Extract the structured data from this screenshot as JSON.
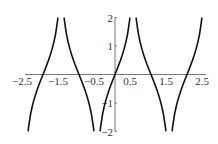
{
  "chart_data": {
    "type": "line",
    "title": "",
    "xlabel": "",
    "ylabel": "",
    "xlim": [
      -2.5,
      2.5
    ],
    "ylim": [
      -2,
      2
    ],
    "grid": false,
    "legend": null,
    "x_ticks": [
      -2.5,
      -1.5,
      -0.5,
      0.5,
      1.5,
      2.5
    ],
    "x_tick_labels": [
      "−2.5",
      "−1.5",
      "−0.5",
      "0.5",
      "1.5",
      "2.5"
    ],
    "y_ticks": [
      2,
      1,
      -1,
      -2
    ],
    "y_tick_labels": [
      "2",
      "1",
      "−1",
      "−2"
    ],
    "series": [
      {
        "name": "f(x)",
        "color": "#111111",
        "branches": [
          {
            "x": [
              -2.414,
              -2.4,
              -2.35,
              -2.3,
              -2.25,
              -2.2,
              -2.15,
              -2.1,
              -2.05,
              -2.0,
              -1.95,
              -1.9,
              -1.85,
              -1.8,
              -1.75,
              -1.7,
              -1.65,
              -1.6,
              -1.586
            ],
            "y": [
              -1.996,
              -1.843,
              -1.427,
              -1.124,
              -0.881,
              -0.674,
              -0.49,
              -0.319,
              -0.158,
              0,
              0.158,
              0.319,
              0.49,
              0.674,
              0.881,
              1.124,
              1.427,
              1.843,
              1.996
            ]
          },
          {
            "x": [
              -1.414,
              -1.4,
              -1.35,
              -1.3,
              -1.25,
              -1.2,
              -1.15,
              -1.1,
              -1.05,
              -1.0,
              -0.95,
              -0.9,
              -0.85,
              -0.8,
              -0.75,
              -0.7,
              -0.65,
              -0.6,
              -0.586
            ],
            "y": [
              1.996,
              1.843,
              1.427,
              1.124,
              0.881,
              0.674,
              0.49,
              0.319,
              0.158,
              0,
              -0.158,
              -0.319,
              -0.49,
              -0.674,
              -0.881,
              -1.124,
              -1.427,
              -1.843,
              -1.996
            ]
          },
          {
            "x": [
              -0.414,
              -0.4,
              -0.35,
              -0.3,
              -0.25,
              -0.2,
              -0.15,
              -0.1,
              -0.05,
              0.0,
              0.05,
              0.1,
              0.15,
              0.2,
              0.25,
              0.3,
              0.35,
              0.4,
              0.414
            ],
            "y": [
              -1.996,
              -1.843,
              -1.427,
              -1.124,
              -0.881,
              -0.674,
              -0.49,
              -0.319,
              -0.158,
              0,
              0.158,
              0.319,
              0.49,
              0.674,
              0.881,
              1.124,
              1.427,
              1.843,
              1.996
            ]
          },
          {
            "x": [
              0.586,
              0.6,
              0.65,
              0.7,
              0.75,
              0.8,
              0.85,
              0.9,
              0.95,
              1.0,
              1.05,
              1.1,
              1.15,
              1.2,
              1.25,
              1.3,
              1.35,
              1.4,
              1.414
            ],
            "y": [
              1.996,
              1.843,
              1.427,
              1.124,
              0.881,
              0.674,
              0.49,
              0.319,
              0.158,
              0,
              -0.158,
              -0.319,
              -0.49,
              -0.674,
              -0.881,
              -1.124,
              -1.427,
              -1.843,
              -1.996
            ]
          },
          {
            "x": [
              1.586,
              1.6,
              1.65,
              1.7,
              1.75,
              1.8,
              1.85,
              1.9,
              1.95,
              2.0,
              2.05,
              2.1,
              2.15,
              2.2,
              2.25,
              2.3,
              2.35,
              2.4,
              2.414
            ],
            "y": [
              -1.996,
              -1.843,
              -1.427,
              -1.124,
              -0.881,
              -0.674,
              -0.49,
              -0.319,
              -0.158,
              0,
              0.158,
              0.319,
              0.49,
              0.674,
              0.881,
              1.124,
              1.427,
              1.843,
              1.996
            ]
          }
        ]
      }
    ],
    "annotations": []
  },
  "layout": {
    "x0_px": 115,
    "x_unit_px": 36,
    "y0_px": 74.5,
    "y_unit_px": 28.5
  }
}
